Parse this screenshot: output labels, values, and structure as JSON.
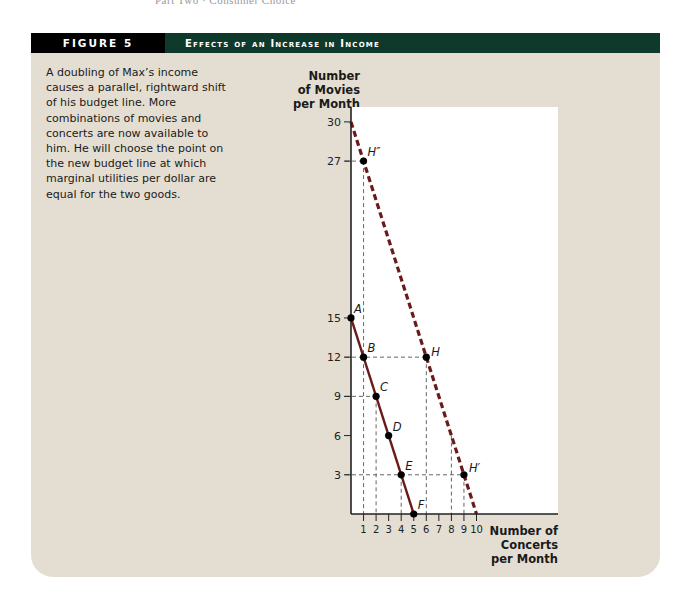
{
  "running_head": "Part Two · Consumer Choice",
  "figure": {
    "label": "FIGURE 5",
    "title": "Effects of an Increase in Income",
    "caption": "A doubling of Max’s income causes a parallel, rightward shift of his budget line. More combinations of movies and concerts are now available to him. He will choose the point on the new budget line at which marginal utilities per dollar are equal for the two goods."
  },
  "colors": {
    "panel_bg": "#e4ded2",
    "header_black": "#000000",
    "header_green": "#0e3a2c",
    "budget_line": "#6b1a1a",
    "plot_bg": "#ffffff"
  },
  "chart_data": {
    "type": "line",
    "title": "Effects of an Increase in Income",
    "xlabel": "Number of Concerts per Month",
    "ylabel": "Number of Movies per Month",
    "xlim": [
      0,
      10
    ],
    "ylim": [
      0,
      30
    ],
    "x_ticks": [
      1,
      2,
      3,
      4,
      5,
      6,
      7,
      8,
      9,
      10
    ],
    "y_ticks": [
      3,
      6,
      9,
      12,
      15,
      27,
      30
    ],
    "grid": false,
    "series": [
      {
        "name": "Original budget line",
        "style": "solid",
        "points": [
          {
            "label": "A",
            "x": 0,
            "y": 15
          },
          {
            "label": "B",
            "x": 1,
            "y": 12
          },
          {
            "label": "C",
            "x": 2,
            "y": 9
          },
          {
            "label": "D",
            "x": 3,
            "y": 6
          },
          {
            "label": "E",
            "x": 4,
            "y": 3
          },
          {
            "label": "F",
            "x": 5,
            "y": 0
          }
        ]
      },
      {
        "name": "New budget line (income doubled)",
        "style": "dashed",
        "endpoints": [
          {
            "x": 0,
            "y": 30
          },
          {
            "x": 10,
            "y": 0
          }
        ],
        "points": [
          {
            "label": "H''",
            "x": 1,
            "y": 27
          },
          {
            "label": "H",
            "x": 6,
            "y": 12
          },
          {
            "label": "H'",
            "x": 9,
            "y": 3
          }
        ]
      }
    ],
    "guide_lines": [
      {
        "type": "h",
        "y": 27,
        "x_to": 1
      },
      {
        "type": "h",
        "y": 12,
        "x_to": 6
      },
      {
        "type": "h",
        "y": 9,
        "x_to": 2
      },
      {
        "type": "h",
        "y": 3,
        "x_to": 9
      },
      {
        "type": "v",
        "x": 1,
        "y_from": 27
      },
      {
        "type": "v",
        "x": 2,
        "y_from": 9
      },
      {
        "type": "v",
        "x": 4,
        "y_from": 3
      },
      {
        "type": "v",
        "x": 6,
        "y_from": 12
      },
      {
        "type": "v",
        "x": 8,
        "y_from": 6
      },
      {
        "type": "v",
        "x": 9,
        "y_from": 3
      }
    ]
  }
}
